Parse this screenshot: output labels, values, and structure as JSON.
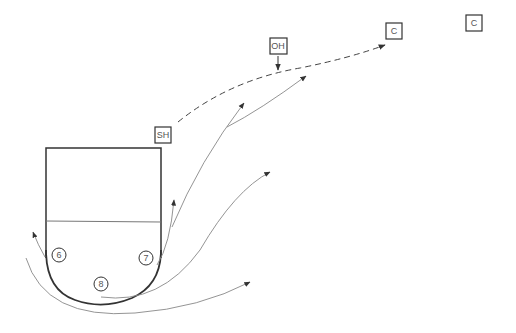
{
  "diagram": {
    "type": "basketball-play",
    "players": [
      {
        "id": "6",
        "label": "6",
        "x": 59,
        "y": 255
      },
      {
        "id": "7",
        "label": "7",
        "x": 146,
        "y": 258
      },
      {
        "id": "8",
        "label": "8",
        "x": 101,
        "y": 284
      }
    ],
    "markers": [
      {
        "id": "SH",
        "label": "SH",
        "x": 163,
        "y": 135
      },
      {
        "id": "OH",
        "label": "OH",
        "x": 278,
        "y": 45
      },
      {
        "id": "C1",
        "label": "C",
        "x": 394,
        "y": 31
      },
      {
        "id": "C2",
        "label": "C",
        "x": 474,
        "y": 23
      }
    ],
    "colors": {
      "court_line": "#333333",
      "path_line": "#777777",
      "marker_border": "#333333",
      "text": "#555555"
    }
  }
}
